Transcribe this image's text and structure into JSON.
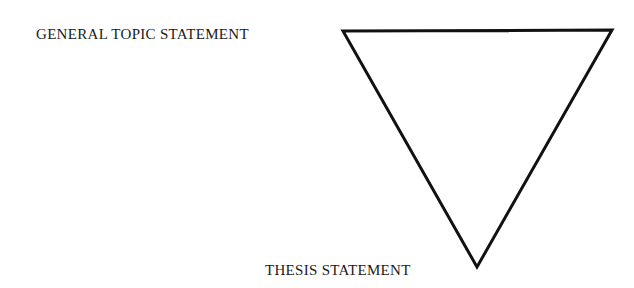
{
  "diagram": {
    "type": "inverted-triangle",
    "labels": {
      "top": "GENERAL TOPIC STATEMENT",
      "bottom": "THESIS STATEMENT"
    },
    "triangle": {
      "points": "343,31 612,30 477,267",
      "stroke": "#111111",
      "stroke_width": 3
    }
  }
}
